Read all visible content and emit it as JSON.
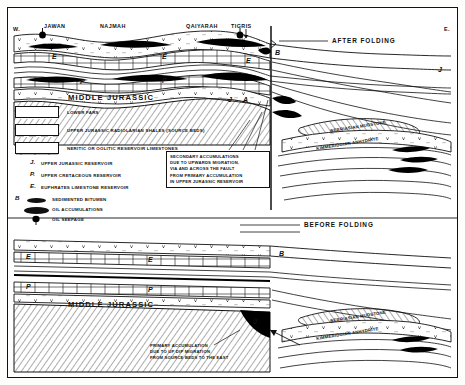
{
  "figure": {
    "orientation_left": "W.",
    "orientation_right": "E.",
    "panel_upper_title": "AFTER FOLDING",
    "panel_lower_title": "BEFORE FOLDING"
  },
  "localities": [
    {
      "name": "JAWAN",
      "marker": "oil-seepage"
    },
    {
      "name": "NAJMAH",
      "marker": "none"
    },
    {
      "name": "QAIYARAH",
      "marker": "none"
    },
    {
      "name": "TIGRIS",
      "marker": "oil-seepage"
    }
  ],
  "formations": {
    "middle_jurassic": "MIDDLE JURASSIC",
    "berriasian_mudstone": "BERRIASIAN MUDSTONE",
    "kimmeridgian_anhydrite": "KIMMERIDGIAN ANHYDRITE"
  },
  "legend": {
    "items": [
      {
        "swatch": "lower-fars-pattern",
        "label": "LOWER FARS"
      },
      {
        "swatch": "radiolarian-shale-pattern",
        "label": "UPPER JURASSIC RADIOLARIAN SHALES (SOURCE BEDS)"
      },
      {
        "swatch": "brick-limestone-pattern",
        "label": "NERITIC OR OOLITIC RESERVOIR LIMESTONES"
      }
    ],
    "reservoirs": [
      {
        "letter": "J.",
        "label": "UPPER JURASSIC RESERVOIR"
      },
      {
        "letter": "P.",
        "label": "UPPER CRETACEOUS RESERVOIR"
      },
      {
        "letter": "E.",
        "label": "EUPHRATES LIMESTONE RESERVOIR"
      }
    ],
    "symbols": [
      {
        "letter": "B",
        "swatch": "bitumen-lens",
        "label": "SEDIMENTED BITUMEN"
      },
      {
        "letter": "",
        "swatch": "oil-lens",
        "label": "OIL ACCUMULATIONS"
      },
      {
        "letter": "",
        "swatch": "seepage-mark",
        "label": "OIL SEEPAGE"
      }
    ]
  },
  "annotations": {
    "upper": [
      "SECONDARY ACCUMULATIONS",
      "DUE TO UPWARDS MIGRATION,",
      "VIA AND ACROSS THE FAULT",
      "FROM PRIMARY ACCUMULATION",
      "IN UPPER JURASSIC RESERVOIR"
    ],
    "lower": [
      "PRIMARY ACCUMULATION",
      "DUE TO UP DIP MIGRATION",
      "FROM SOURCE BEDS TO THE EAST"
    ]
  },
  "unit_markers": {
    "upper": [
      "E",
      "E",
      "P",
      "P",
      "E",
      "B",
      "J",
      "J",
      "A"
    ],
    "lower": [
      "E",
      "E",
      "P",
      "P",
      "B",
      "J"
    ]
  },
  "colors": {
    "ink": "#111111",
    "paper": "#ffffff",
    "oil": "#000000"
  }
}
